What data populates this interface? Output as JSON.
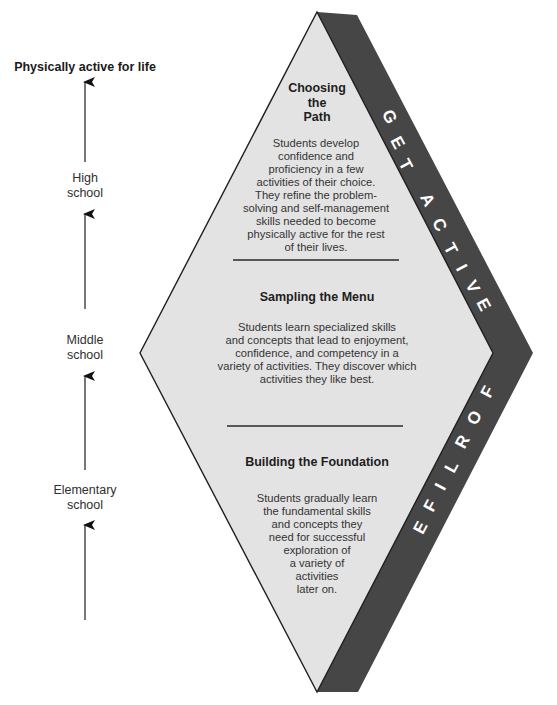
{
  "progression": {
    "goal": "Physically active for life",
    "stages": [
      {
        "label": "High\nschool"
      },
      {
        "label": "Middle\nschool"
      },
      {
        "label": "Elementary\nschool"
      }
    ],
    "arrow_count": 4
  },
  "diamond": {
    "sections": [
      {
        "title": "Choosing\nthe\nPath",
        "body": "Students develop\nconfidence and\nproficiency in a few\nactivities of their choice.\nThey refine the problem-\nsolving and self-management\nskills needed to become\nphysically active for the rest\nof their lives."
      },
      {
        "title": "Sampling the Menu",
        "body": "Students learn specialized skills\nand concepts that lead to enjoyment,\nconfidence, and competency in a\nvariety of activities. They discover which\nactivities they like best."
      },
      {
        "title": "Building the Foundation",
        "body": "Students gradually learn\nthe fundamental skills\nand concepts they\nneed for successful\nexploration of\na variety of\nactivities\nlater on."
      }
    ]
  },
  "band": {
    "upper_text": "GET ACTIVE",
    "lower_text": "FOR LIFE"
  },
  "colors": {
    "diamond_fill": "#e3e3e3",
    "band_fill": "#464646",
    "outline": "#1f1f1f",
    "arrow": "#555555",
    "band_text": "#ffffff"
  }
}
